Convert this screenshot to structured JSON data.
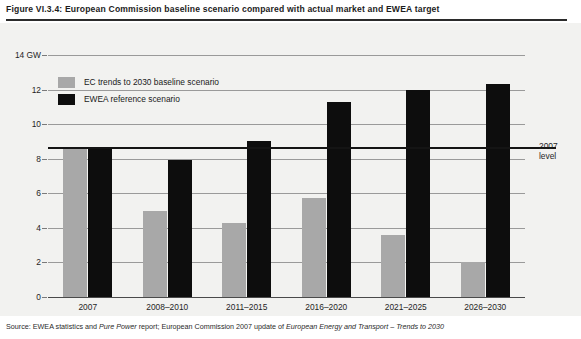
{
  "figure": {
    "caption": "Figure VI.3.4: European Commission baseline scenario compared with actual market and EWEA target",
    "source_prefix": "Source: EWEA statistics and ",
    "source_italic_1": "Pure Power",
    "source_mid": " report; European Commission 2007 update of ",
    "source_italic_2": "European Energy and Transport – Trends to 2030",
    "source_full": "Source: EWEA statistics and Pure Power report; European Commission 2007 update of European Energy and Transport – Trends to 2030"
  },
  "annotation": {
    "level_line_label_1": "2007",
    "level_line_label_2": "level",
    "level_value": 8.7
  },
  "chart_data": {
    "type": "bar",
    "title": "European Commission baseline scenario compared with actual market and EWEA target",
    "xlabel": "",
    "ylabel": "14 GW",
    "ylim": [
      0,
      14
    ],
    "yticks": [
      0,
      2,
      4,
      6,
      8,
      10,
      12,
      14
    ],
    "ytick_labels": [
      "0",
      "2",
      "4",
      "6",
      "8",
      "10",
      "12",
      "14 GW"
    ],
    "grid": true,
    "legend_position": "top-left",
    "categories": [
      "2007",
      "2008–2010",
      "2011–2015",
      "2016–2020",
      "2021–2025",
      "2026–2030"
    ],
    "series": [
      {
        "name": "EC trends to 2030 baseline scenario",
        "color": "#a8a8a8",
        "values": [
          8.7,
          5.0,
          4.3,
          5.7,
          3.6,
          2.0
        ]
      },
      {
        "name": "EWEA reference scenario",
        "color": "#0d0d0d",
        "values": [
          8.7,
          7.9,
          9.0,
          11.3,
          12.0,
          12.3
        ]
      }
    ],
    "annotations": [
      {
        "type": "hline",
        "value": 8.7,
        "label": "2007 level",
        "color": "#141414"
      }
    ]
  }
}
